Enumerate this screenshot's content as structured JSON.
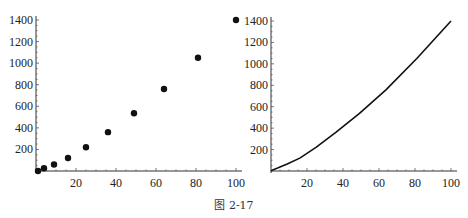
{
  "caption": "图 2-17",
  "chart_data": [
    {
      "type": "scatter",
      "title": "",
      "xlabel": "",
      "ylabel": "",
      "x": [
        1,
        4,
        9,
        16,
        25,
        36,
        49,
        64,
        81,
        100
      ],
      "y": [
        0,
        25,
        60,
        120,
        220,
        360,
        535,
        760,
        1050,
        1400
      ],
      "x_ticks": [
        20,
        40,
        60,
        80,
        100
      ],
      "y_ticks": [
        200,
        400,
        600,
        800,
        1000,
        1200,
        1400
      ],
      "xlim": [
        0,
        100
      ],
      "ylim": [
        0,
        1400
      ],
      "grid": false,
      "legend": null,
      "marker_color": "#111111"
    },
    {
      "type": "line",
      "title": "",
      "xlabel": "",
      "ylabel": "",
      "x": [
        0,
        1,
        4,
        9,
        16,
        25,
        36,
        49,
        64,
        81,
        100
      ],
      "y": [
        0,
        10,
        30,
        65,
        120,
        220,
        360,
        535,
        760,
        1050,
        1400
      ],
      "x_ticks": [
        20,
        40,
        60,
        80,
        100
      ],
      "y_ticks": [
        200,
        400,
        600,
        800,
        1000,
        1200,
        1400
      ],
      "xlim": [
        0,
        100
      ],
      "ylim": [
        0,
        1400
      ],
      "grid": false,
      "legend": null,
      "line_color": "#111111"
    }
  ]
}
